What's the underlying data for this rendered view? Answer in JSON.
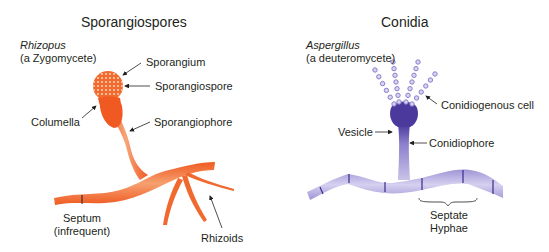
{
  "panels": {
    "left": {
      "title": "Sporangiospores",
      "organism": "Rhizopus",
      "group": "(a Zygomycete)",
      "color": "#f26a2e",
      "labels": {
        "sporangium": "Sporangium",
        "sporangiospore": "Sporangiospore",
        "columella": "Columella",
        "sporangiophore": "Sporangiophore",
        "septum_line1": "Septum",
        "septum_line2": "(infrequent)",
        "rhizoids": "Rhizoids"
      }
    },
    "right": {
      "title": "Conidia",
      "organism": "Aspergillus",
      "group": "(a deuteromycete)",
      "color": "#5b48a8",
      "labels": {
        "conidiogenous_cell": "Conidiogenous cell",
        "vesicle": "Vesicle",
        "conidiophore": "Conidiophore",
        "septate_line1": "Septate",
        "septate_line2": "Hyphae"
      }
    }
  }
}
